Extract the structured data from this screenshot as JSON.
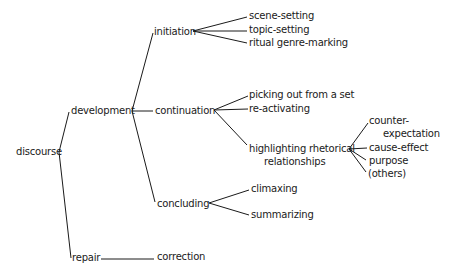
{
  "diagram": {
    "type": "tree",
    "root": "discourse",
    "nodes": {
      "discourse": "discourse",
      "development": "development",
      "repair": "repair",
      "correction": "correction",
      "initiation": "initiation",
      "continuation": "continuation",
      "concluding": "concluding",
      "scene_setting": "scene-setting",
      "topic_setting": "topic-setting",
      "ritual_genre_marking": "ritual genre-marking",
      "picking_out": "picking out from a set",
      "re_activating": "re-activating",
      "highlighting_line1": "highlighting rhetorical",
      "highlighting_line2": "relationships",
      "counter_line1": "counter-",
      "counter_line2": "expectation",
      "cause_effect": "cause-effect",
      "purpose": "purpose",
      "others": "(others)",
      "climaxing": "climaxing",
      "summarizing": "summarizing"
    },
    "edges": [
      [
        "discourse",
        "development"
      ],
      [
        "discourse",
        "repair"
      ],
      [
        "repair",
        "correction"
      ],
      [
        "development",
        "initiation"
      ],
      [
        "development",
        "continuation"
      ],
      [
        "development",
        "concluding"
      ],
      [
        "initiation",
        "scene-setting"
      ],
      [
        "initiation",
        "topic-setting"
      ],
      [
        "initiation",
        "ritual genre-marking"
      ],
      [
        "continuation",
        "picking out from a set"
      ],
      [
        "continuation",
        "re-activating"
      ],
      [
        "continuation",
        "highlighting rhetorical relationships"
      ],
      [
        "highlighting rhetorical relationships",
        "counter-expectation"
      ],
      [
        "highlighting rhetorical relationships",
        "cause-effect"
      ],
      [
        "highlighting rhetorical relationships",
        "purpose"
      ],
      [
        "highlighting rhetorical relationships",
        "(others)"
      ],
      [
        "concluding",
        "climaxing"
      ],
      [
        "concluding",
        "summarizing"
      ]
    ],
    "line_color": "#1a1a1a",
    "text_color": "#1a1a1a"
  }
}
